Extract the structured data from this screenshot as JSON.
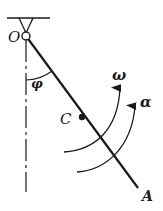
{
  "diagram": {
    "type": "pendulum-rod",
    "labels": {
      "pivot": "O",
      "angle": "φ",
      "center": "C",
      "end": "A",
      "angular_velocity": "ω",
      "angular_acceleration": "α"
    },
    "colors": {
      "line": "#1a1a1a",
      "background": "#ffffff"
    }
  }
}
